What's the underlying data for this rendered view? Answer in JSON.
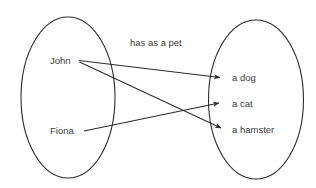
{
  "diagram": {
    "kind": "set-mapping-diagram",
    "relation_label": "has as a pet",
    "stroke_color": "#2b2b2b",
    "text_color": "#3b3b3b",
    "background_color": "#ffffff",
    "domain_set": {
      "name": "domain-ellipse",
      "members": [
        {
          "label": "John",
          "x": 50,
          "y": 56
        },
        {
          "label": "Fiona",
          "x": 50,
          "y": 126
        }
      ]
    },
    "codomain_set": {
      "name": "codomain-ellipse",
      "members": [
        {
          "label": "a dog",
          "x": 232,
          "y": 73
        },
        {
          "label": "a cat",
          "x": 232,
          "y": 99
        },
        {
          "label": "a hamster",
          "x": 232,
          "y": 125
        }
      ]
    },
    "mappings": [
      {
        "from": "John",
        "to": "a dog"
      },
      {
        "from": "John",
        "to": "a hamster"
      },
      {
        "from": "Fiona",
        "to": "a cat"
      }
    ]
  }
}
